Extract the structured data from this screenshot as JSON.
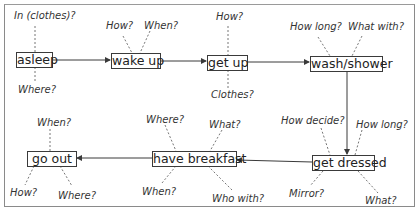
{
  "diagram": {
    "type": "flowchart",
    "colors": {
      "line": "#3a3a3a",
      "dotted": "#777777",
      "frame": "#8a8a8a",
      "text": "#222222"
    },
    "nodes": [
      {
        "id": "asleep",
        "label": "asleep",
        "questions": [
          "In (clothes)?",
          "Where?"
        ]
      },
      {
        "id": "wake_up",
        "label": "wake up",
        "questions": [
          "How?",
          "When?"
        ]
      },
      {
        "id": "get_up",
        "label": "get up",
        "questions": [
          "How?",
          "Clothes?"
        ]
      },
      {
        "id": "wash_shower",
        "label": "wash/shower",
        "questions": [
          "How long?",
          "What with?"
        ]
      },
      {
        "id": "get_dressed",
        "label": "get dressed",
        "questions": [
          "How decide?",
          "How long?",
          "Mirror?",
          "What?"
        ]
      },
      {
        "id": "have_breakfast",
        "label": "have breakfast",
        "questions": [
          "Where?",
          "What?",
          "When?",
          "Who with?"
        ]
      },
      {
        "id": "go_out",
        "label": "go out",
        "questions": [
          "When?",
          "How?",
          "Where?"
        ]
      }
    ],
    "edges": [
      {
        "from": "asleep",
        "to": "wake_up"
      },
      {
        "from": "wake_up",
        "to": "get_up"
      },
      {
        "from": "get_up",
        "to": "wash_shower"
      },
      {
        "from": "wash_shower",
        "to": "get_dressed"
      },
      {
        "from": "get_dressed",
        "to": "have_breakfast"
      },
      {
        "from": "have_breakfast",
        "to": "go_out"
      }
    ]
  }
}
